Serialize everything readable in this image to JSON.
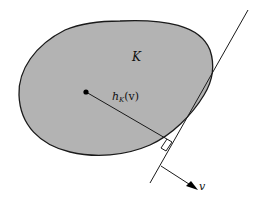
{
  "diagram": {
    "labels": {
      "body": "K",
      "support_h": "h",
      "support_sub": "K",
      "support_arg": "(v)",
      "direction": "v"
    },
    "colors": {
      "body_fill": "#b3b3b3",
      "stroke": "#1a1a1a",
      "background": "#ffffff"
    },
    "elements": [
      {
        "id": "convex-body",
        "type": "closed-curve",
        "label": "K"
      },
      {
        "id": "center-point",
        "type": "point",
        "x": 86,
        "y": 92
      },
      {
        "id": "support-segment",
        "type": "segment",
        "label": "h_K(v)"
      },
      {
        "id": "tangent-line",
        "type": "line"
      },
      {
        "id": "right-angle-marker",
        "type": "marker"
      },
      {
        "id": "direction-arrow",
        "type": "arrow",
        "label": "v"
      }
    ]
  }
}
